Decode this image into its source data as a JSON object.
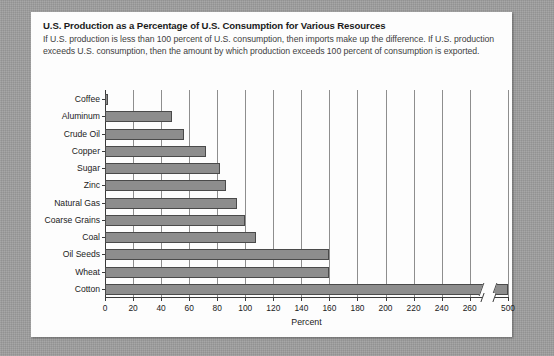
{
  "figure": {
    "title": "U.S. Production as a Percentage of U.S. Consumption for Various Resources",
    "caption": "If U.S. production is less than 100 percent of U.S. consumption, then imports make up the difference. If U.S. production exceeds U.S. consumption, then the amount by which production exceeds 100 percent of consumption is exported."
  },
  "colors": {
    "page_background": "#9b9b9b",
    "card_background": "#fdfdfd",
    "bar_fill": "#8d8d8d",
    "bar_stroke": "#4a4a4a",
    "gridline": "#8e8e8e",
    "axis": "#3a3a3a",
    "title_text": "#1b1b1b",
    "caption_text": "#3e3e3e"
  },
  "chart_data": {
    "type": "bar",
    "orientation": "horizontal",
    "title": "U.S. Production as a Percentage of U.S. Consumption for Various Resources",
    "xlabel": "Percent",
    "ylabel": "",
    "categories": [
      "Coffee",
      "Aluminum",
      "Crude Oil",
      "Copper",
      "Sugar",
      "Zinc",
      "Natural Gas",
      "Coarse Grains",
      "Coal",
      "Oil Seeds",
      "Wheat",
      "Cotton"
    ],
    "values": [
      2,
      48,
      56,
      72,
      82,
      86,
      94,
      100,
      108,
      160,
      160,
      500
    ],
    "xlim": [
      0,
      500
    ],
    "xticks": [
      0,
      20,
      40,
      60,
      80,
      100,
      120,
      140,
      160,
      180,
      200,
      220,
      240,
      260,
      500
    ],
    "xtick_labels": [
      "0",
      "20",
      "40",
      "60",
      "80",
      "100",
      "120",
      "140",
      "160",
      "180",
      "200",
      "220",
      "240",
      "260",
      "500"
    ],
    "axis_break": {
      "present": true,
      "between": [
        260,
        500
      ],
      "style": "double-diagonal-slash"
    },
    "grid": "vertical",
    "legend": "none"
  }
}
